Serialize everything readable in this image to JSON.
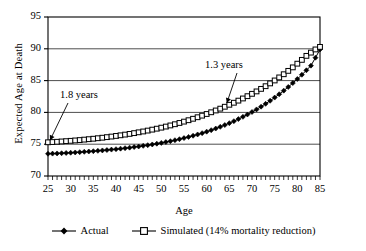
{
  "chart_data": {
    "type": "line",
    "title": "",
    "xlabel": "Age",
    "ylabel": "Expected Age at Death",
    "xlim": [
      25,
      85
    ],
    "ylim": [
      70,
      95
    ],
    "xticks": [
      25,
      30,
      35,
      40,
      45,
      50,
      55,
      60,
      65,
      70,
      75,
      80,
      85
    ],
    "yticks": [
      70,
      75,
      80,
      85,
      90,
      95
    ],
    "grid": "horizontal",
    "legend_position": "bottom",
    "minor_xtick_step": 1,
    "x": [
      25,
      26,
      27,
      28,
      29,
      30,
      31,
      32,
      33,
      34,
      35,
      36,
      37,
      38,
      39,
      40,
      41,
      42,
      43,
      44,
      45,
      46,
      47,
      48,
      49,
      50,
      51,
      52,
      53,
      54,
      55,
      56,
      57,
      58,
      59,
      60,
      61,
      62,
      63,
      64,
      65,
      66,
      67,
      68,
      69,
      70,
      71,
      72,
      73,
      74,
      75,
      76,
      77,
      78,
      79,
      80,
      81,
      82,
      83,
      84,
      85
    ],
    "series": [
      {
        "name": "Actual",
        "marker": "filled-diamond",
        "values": [
          73.5,
          73.52,
          73.55,
          73.58,
          73.62,
          73.66,
          73.7,
          73.75,
          73.8,
          73.85,
          73.9,
          73.96,
          74.02,
          74.08,
          74.15,
          74.22,
          74.3,
          74.38,
          74.46,
          74.55,
          74.64,
          74.74,
          74.85,
          74.96,
          75.08,
          75.2,
          75.34,
          75.48,
          75.63,
          75.79,
          75.96,
          76.14,
          76.33,
          76.53,
          76.74,
          76.97,
          77.21,
          77.46,
          77.73,
          78.01,
          78.31,
          78.62,
          78.95,
          79.3,
          79.67,
          80.06,
          80.47,
          80.9,
          81.35,
          81.83,
          82.33,
          82.86,
          83.42,
          84.0,
          84.61,
          85.25,
          85.92,
          86.62,
          87.35,
          88.6,
          89.9
        ]
      },
      {
        "name": "Simulated (14% mortality reduction)",
        "marker": "open-square",
        "values": [
          75.3,
          75.34,
          75.38,
          75.43,
          75.48,
          75.53,
          75.59,
          75.65,
          75.72,
          75.79,
          75.86,
          75.94,
          76.02,
          76.11,
          76.2,
          76.3,
          76.4,
          76.51,
          76.62,
          76.74,
          76.87,
          77.0,
          77.14,
          77.29,
          77.44,
          77.6,
          77.77,
          77.95,
          78.14,
          78.34,
          78.55,
          78.77,
          79.0,
          79.24,
          79.49,
          79.75,
          80.02,
          80.3,
          80.59,
          80.89,
          81.2,
          81.52,
          81.85,
          82.19,
          82.55,
          82.92,
          83.3,
          83.7,
          84.12,
          84.56,
          85.02,
          85.5,
          86.0,
          86.53,
          87.08,
          87.66,
          88.26,
          88.89,
          89.4,
          89.9,
          90.3
        ]
      }
    ],
    "annotations": [
      {
        "text": "1.8 years",
        "arrow_target_age": 25,
        "arrow_target_value": 75.3
      },
      {
        "text": "1.3 years",
        "arrow_target_age": 64,
        "arrow_target_value": 81.0
      }
    ]
  },
  "legend": {
    "items": [
      {
        "label": "Actual"
      },
      {
        "label": "Simulated (14% mortality reduction)"
      }
    ]
  }
}
